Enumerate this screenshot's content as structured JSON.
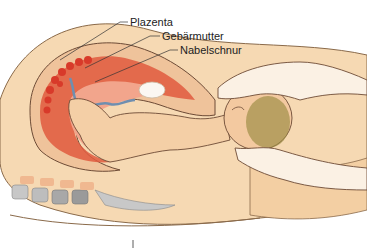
{
  "figure": {
    "type": "anatomical-illustration",
    "labels": [
      {
        "id": "plazenta",
        "text": "Plazenta"
      },
      {
        "id": "gebaermutter",
        "text": "Gebärmutter"
      },
      {
        "id": "nabelschnur",
        "text": "Nabelschnur"
      }
    ]
  }
}
